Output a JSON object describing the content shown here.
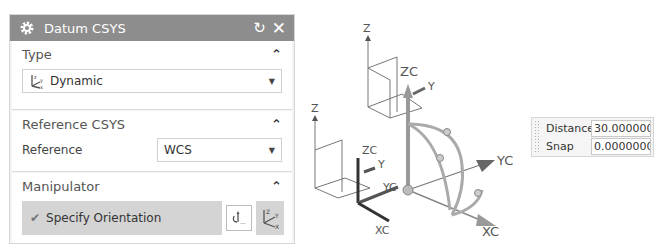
{
  "dialog": {
    "title": "Datum CSYS",
    "icons": {
      "title": "gear-icon",
      "reset": "reset-icon",
      "close": "close-icon"
    },
    "reset_glyph": "↻",
    "close_glyph": "✕",
    "sections": {
      "type": {
        "label": "Type",
        "caret": "^",
        "selected": "Dynamic"
      },
      "reference_csys": {
        "label": "Reference CSYS",
        "caret": "^",
        "field_label": "Reference",
        "selected": "WCS"
      },
      "manipulator": {
        "label": "Manipulator",
        "caret": "^",
        "action_label": "Specify Orientation",
        "check": "✔"
      }
    }
  },
  "viewport": {
    "labels": {
      "z1": "Z",
      "zc1": "ZC",
      "y1": "Y",
      "z2": "Z",
      "zc2": "ZC",
      "y2": "Y",
      "yc2": "YC",
      "xc2": "XC",
      "yc_main": "YC",
      "xc_main": "XC"
    }
  },
  "input_box": {
    "distance_label": "Distance",
    "distance_value": "30.000000",
    "snap_label": "Snap",
    "snap_value": "0.0000000"
  },
  "colors": {
    "titlebar": "#8d8d8d",
    "section_bg": "#ffffff",
    "panel_bg": "#f3f3f3",
    "orient_bg": "#d4d4d4"
  }
}
